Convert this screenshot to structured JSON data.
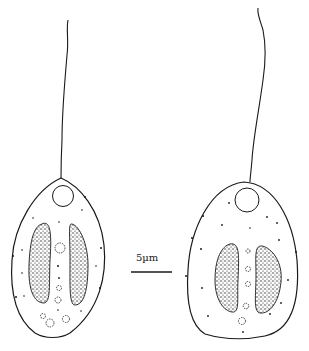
{
  "figure": {
    "scale_bar": {
      "label": "5µm",
      "x1": 131,
      "x2": 172,
      "y": 272
    },
    "colors": {
      "ink": "#1a1a1a",
      "background": "#ffffff"
    },
    "cells": [
      {
        "id": "left-cell",
        "shape": "obovate"
      },
      {
        "id": "right-cell",
        "shape": "ovoid"
      }
    ]
  }
}
